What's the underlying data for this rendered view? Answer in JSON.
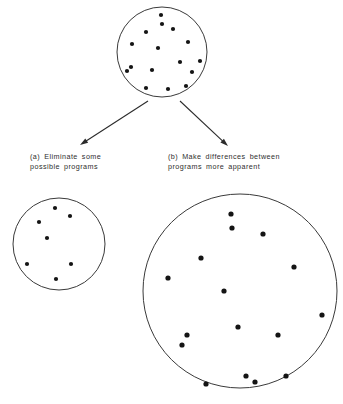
{
  "figure": {
    "background_color": "#ffffff",
    "line_color": "#3a3a3a",
    "dot_color": "#141414",
    "text_color": "#2e2e2e",
    "width": 343,
    "height": 404
  },
  "captions": {
    "a": "(a) Eliminate some\npossible programs",
    "b": "(b) Make differences between\nprograms more apparent"
  },
  "chart_data": {
    "type": "scatter",
    "xlabel": "",
    "ylabel": "",
    "grid": false,
    "legend": "none",
    "groups": [
      {
        "name": "initial-program-space",
        "label": "Top circle: full set of possible programs",
        "circle": {
          "cx": 162,
          "cy": 52,
          "r": 45
        },
        "dot_radius": 2.1,
        "count": 16,
        "points": [
          [
            161,
            15
          ],
          [
            162,
            24
          ],
          [
            173,
            29
          ],
          [
            146,
            32
          ],
          [
            188,
            42
          ],
          [
            132,
            44
          ],
          [
            158,
            48
          ],
          [
            200,
            61
          ],
          [
            180,
            62
          ],
          [
            131,
            67
          ],
          [
            152,
            70
          ],
          [
            127,
            71
          ],
          [
            192,
            72
          ],
          [
            146,
            88
          ],
          [
            168,
            89
          ],
          [
            186,
            86
          ]
        ]
      },
      {
        "name": "reduced-program-space",
        "label": "Lower-left circle: fewer possible programs",
        "circle": {
          "cx": 59,
          "cy": 244,
          "r": 46
        },
        "dot_radius": 2.1,
        "count": 7,
        "points": [
          [
            55,
            208
          ],
          [
            70,
            216
          ],
          [
            39,
            222
          ],
          [
            47,
            238
          ],
          [
            27,
            264
          ],
          [
            71,
            264
          ],
          [
            56,
            279
          ]
        ]
      },
      {
        "name": "expanded-program-space",
        "label": "Lower-right circle: same programs, differences more apparent",
        "circle": {
          "cx": 240,
          "cy": 291,
          "r": 97
        },
        "dot_radius": 2.6,
        "count": 16,
        "points": [
          [
            231,
            214
          ],
          [
            232,
            228
          ],
          [
            263,
            234
          ],
          [
            201,
            258
          ],
          [
            294,
            267
          ],
          [
            168,
            278
          ],
          [
            224,
            291
          ],
          [
            322,
            315
          ],
          [
            238,
            327
          ],
          [
            187,
            335
          ],
          [
            278,
            335
          ],
          [
            182,
            345
          ],
          [
            246,
            376
          ],
          [
            286,
            376
          ],
          [
            206,
            384
          ],
          [
            255,
            382
          ]
        ]
      }
    ],
    "arrows": [
      {
        "name": "arrow-to-left-circle",
        "from": [
          148,
          101
        ],
        "to": [
          80,
          145
        ],
        "direction": "down-left"
      },
      {
        "name": "arrow-to-right-circle",
        "from": [
          180,
          101
        ],
        "to": [
          228,
          146
        ],
        "direction": "down-right"
      }
    ],
    "annotations": [
      {
        "name": "caption-a",
        "text": "(a) Eliminate some possible programs",
        "position": [
          30,
          152
        ]
      },
      {
        "name": "caption-b",
        "text": "(b) Make differences between programs more apparent",
        "position": [
          168,
          152
        ]
      }
    ]
  }
}
